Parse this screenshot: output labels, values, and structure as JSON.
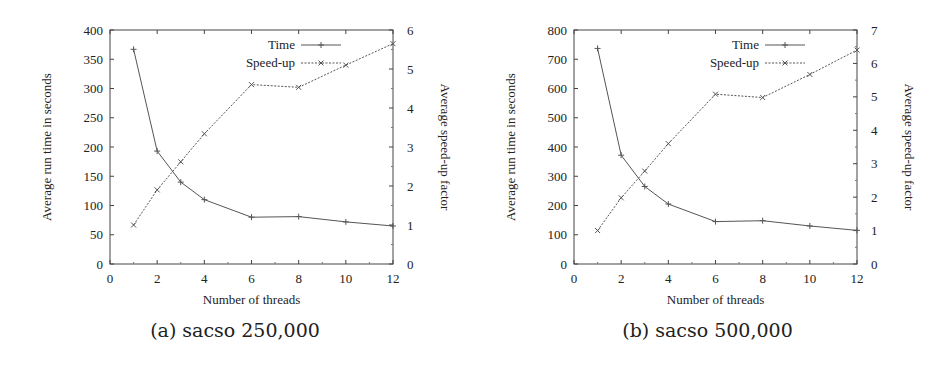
{
  "figures": [
    {
      "caption": "(a) sacso 250,000",
      "x_ticks": [
        "0",
        "2",
        "4",
        "6",
        "8",
        "10",
        "12"
      ],
      "y_left_ticks": [
        "0",
        "50",
        "100",
        "150",
        "200",
        "250",
        "300",
        "350",
        "400"
      ],
      "y_right_ticks": [
        "0",
        "1",
        "2",
        "3",
        "4",
        "5",
        "6"
      ],
      "xlabel": "Number of threads",
      "ylabel_left": "Average run time in seconds",
      "ylabel_right": "Average speed-up factor",
      "legend": [
        "Time",
        "Speed-up"
      ]
    },
    {
      "caption": "(b) sacso 500,000",
      "x_ticks": [
        "0",
        "2",
        "4",
        "6",
        "8",
        "10",
        "12"
      ],
      "y_left_ticks": [
        "0",
        "100",
        "200",
        "300",
        "400",
        "500",
        "600",
        "700",
        "800"
      ],
      "y_right_ticks": [
        "0",
        "1",
        "2",
        "3",
        "4",
        "5",
        "6",
        "7"
      ],
      "xlabel": "Number of threads",
      "ylabel_left": "Average run time in seconds",
      "ylabel_right": "Average speed-up factor",
      "legend": [
        "Time",
        "Speed-up"
      ]
    }
  ],
  "chart_data": [
    {
      "type": "line",
      "title": "(a) sacso 250,000",
      "xlabel": "Number of threads",
      "ylabel": "Average run time in seconds",
      "y2label": "Average speed-up factor",
      "x": [
        1,
        2,
        3,
        4,
        6,
        8,
        10,
        12
      ],
      "xlim": [
        0,
        12
      ],
      "ylim": [
        0,
        400
      ],
      "y2lim": [
        0,
        6
      ],
      "grid": false,
      "legend_position": "top-right",
      "series": [
        {
          "name": "Time",
          "axis": "left",
          "style": "solid",
          "marker": "+",
          "values": [
            367,
            193,
            140,
            110,
            80,
            81,
            72,
            65
          ]
        },
        {
          "name": "Speed-up",
          "axis": "right",
          "style": "dashed",
          "marker": "x",
          "values": [
            1.0,
            1.9,
            2.62,
            3.34,
            4.6,
            4.53,
            5.1,
            5.65
          ]
        }
      ]
    },
    {
      "type": "line",
      "title": "(b) sacso 500,000",
      "xlabel": "Number of threads",
      "ylabel": "Average run time in seconds",
      "y2label": "Average speed-up factor",
      "x": [
        1,
        2,
        3,
        4,
        6,
        8,
        10,
        12
      ],
      "xlim": [
        0,
        12
      ],
      "ylim": [
        0,
        800
      ],
      "y2lim": [
        0,
        7
      ],
      "grid": false,
      "legend_position": "top-right",
      "series": [
        {
          "name": "Time",
          "axis": "left",
          "style": "solid",
          "marker": "+",
          "values": [
            737,
            372,
            265,
            205,
            145,
            148,
            130,
            115
          ]
        },
        {
          "name": "Speed-up",
          "axis": "right",
          "style": "dashed",
          "marker": "x",
          "values": [
            1.0,
            1.98,
            2.78,
            3.6,
            5.08,
            4.98,
            5.67,
            6.4
          ]
        }
      ]
    }
  ]
}
